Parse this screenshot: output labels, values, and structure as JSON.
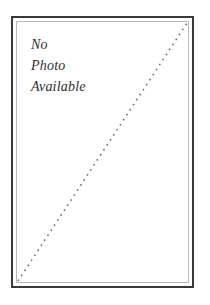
{
  "placeholder": {
    "message_lines": [
      {
        "text": "No"
      },
      {
        "text": "Photo"
      },
      {
        "text": "Available"
      }
    ],
    "frame": {
      "outer_border_color": "#3a3a3c",
      "inner_border_color": "#b9b9bd",
      "background_color": "#ffffff"
    },
    "diagonal": {
      "name": "dotted-diagonal-slash",
      "style": "dotted",
      "color": "#6d6d72",
      "dot_size_px": 1.6,
      "dot_gap_px": 4.4,
      "from": "bottom-left",
      "to": "top-right"
    },
    "page": {
      "background_color": "#ffffff",
      "text_color": "#2e2e30"
    }
  }
}
